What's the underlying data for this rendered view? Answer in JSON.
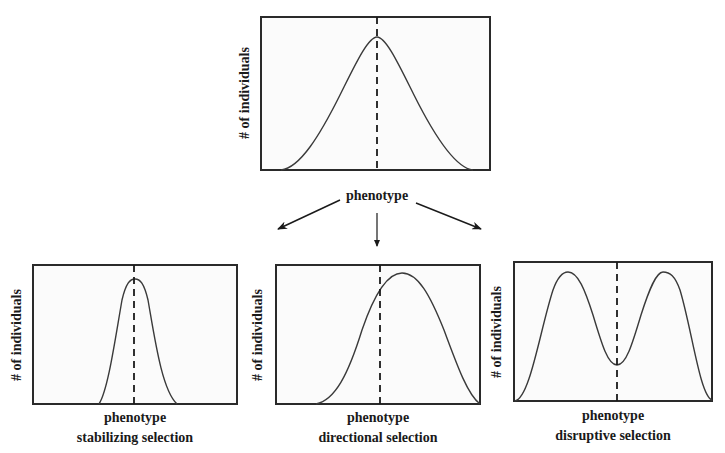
{
  "diagram": {
    "original": {
      "xlabel": "phenotype",
      "ylabel": "# of individuals",
      "curve": "single symmetric bell curve centered on dashed mean line"
    },
    "panels": [
      {
        "name": "stabilizing",
        "xlabel": "phenotype",
        "caption": "stabilizing selection",
        "ylabel": "# of individuals",
        "curve": "narrow tall peak centered on mean"
      },
      {
        "name": "directional",
        "xlabel": "phenotype",
        "caption": "directional selection",
        "ylabel": "# of individuals",
        "curve": "peak shifted right of mean"
      },
      {
        "name": "disruptive",
        "xlabel": "phenotype",
        "caption": "disruptive selection",
        "ylabel": "# of individuals",
        "curve": "two peaks with dip at mean"
      }
    ],
    "arrows": [
      "to-stabilizing",
      "to-directional",
      "to-disruptive"
    ],
    "colors": {
      "line": "#3a3a3a",
      "frame": "#2a2a2a",
      "dashed": "#1a1a1a",
      "background": "#ffffff"
    }
  }
}
